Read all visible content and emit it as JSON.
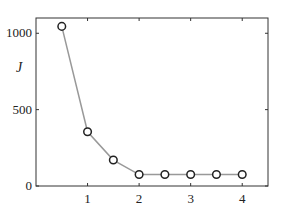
{
  "chart_data": {
    "type": "line",
    "title": "",
    "xlabel": "",
    "ylabel": "J",
    "x": [
      0.5,
      1.0,
      1.5,
      2.0,
      2.5,
      3.0,
      3.5,
      4.0
    ],
    "series": [
      {
        "name": "J",
        "values": [
          1045,
          355,
          170,
          75,
          75,
          75,
          75,
          75
        ],
        "line_color": "#999999",
        "marker": "circle",
        "marker_color": "#222222"
      }
    ],
    "xlim": [
      0,
      4.5
    ],
    "ylim": [
      0,
      1100
    ],
    "xticks": [
      1,
      2,
      3,
      4
    ],
    "xtick_labels": [
      "1",
      "2",
      "3",
      "4"
    ],
    "yticks": [
      0,
      500,
      1000
    ],
    "ytick_labels": [
      "0",
      "500",
      "1000"
    ],
    "grid": false,
    "legend": null
  }
}
